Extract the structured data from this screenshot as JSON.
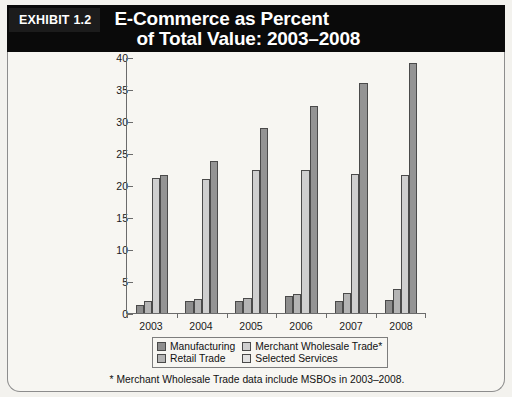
{
  "header": {
    "exhibit_tag": "EXHIBIT 1.2",
    "title_line_1": "E-Commerce as Percent",
    "title_line_2": "of Total Value: 2003–2008",
    "background_color": "#0a0a0a",
    "text_color": "#ffffff"
  },
  "footnote": "* Merchant Wholesale Trade data include MSBOs in 2003–2008.",
  "legend": {
    "items": [
      {
        "label": "Manufacturing",
        "color": "#8e8e8e"
      },
      {
        "label": "Merchant Wholesale Trade*",
        "color": "#cfcfcf"
      },
      {
        "label": "Retail Trade",
        "color": "#b4b4b4"
      },
      {
        "label": "Selected Services",
        "color": "#e2e2e2"
      }
    ]
  },
  "chart_data": {
    "type": "bar",
    "title": "E-Commerce as Percent of Total Value: 2003–2008",
    "xlabel": "",
    "ylabel": "",
    "ylim": [
      0,
      40
    ],
    "yticks": [
      0,
      5,
      10,
      15,
      20,
      25,
      30,
      35,
      40
    ],
    "ytick_labels": [
      "0",
      "5",
      "10",
      "15",
      "20",
      "25",
      "30",
      "35",
      "40"
    ],
    "grid": false,
    "legend_position": "bottom",
    "categories": [
      "2003",
      "2004",
      "2005",
      "2006",
      "2007",
      "2008"
    ],
    "series": [
      {
        "name": "Manufacturing",
        "color": "#8e8e8e",
        "values": [
          1.3,
          1.9,
          1.8,
          2.7,
          1.8,
          2.1
        ]
      },
      {
        "name": "Retail Trade",
        "color": "#b4b4b4",
        "values": [
          1.8,
          2.2,
          2.4,
          2.9,
          3.2,
          3.7
        ]
      },
      {
        "name": "Merchant Wholesale Trade*",
        "color": "#cfcfcf",
        "values": [
          21.1,
          20.9,
          22.4,
          22.3,
          21.7,
          21.5
        ]
      },
      {
        "name": "Selected Services",
        "color": "#949494",
        "values": [
          21.5,
          23.7,
          28.9,
          32.4,
          36.0,
          39.1
        ]
      }
    ]
  }
}
